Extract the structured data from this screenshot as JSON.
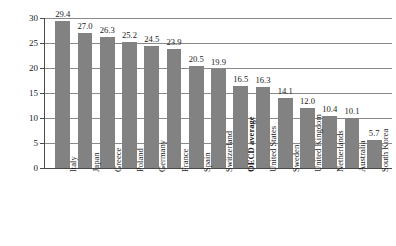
{
  "chart_data": {
    "type": "bar",
    "title": "",
    "xlabel": "",
    "ylabel": "Percentage of government spending",
    "ylim": [
      0,
      30
    ],
    "yticks": [
      0,
      5,
      10,
      15,
      20,
      25,
      30
    ],
    "ytick_labels": [
      "0",
      "5",
      "10",
      "15",
      "20",
      "25",
      "30"
    ],
    "grid": true,
    "legend": false,
    "bar_color": "#828282",
    "categories": [
      "Italy",
      "Japan",
      "Greece",
      "Poland",
      "Germany",
      "France",
      "Spain",
      "Switzerland",
      "OECD average",
      "United States",
      "Sweden",
      "United Kingdom",
      "Netherlands",
      "Australia",
      "South Korea"
    ],
    "values": [
      29.4,
      27.0,
      26.3,
      25.2,
      24.5,
      23.9,
      20.5,
      19.9,
      16.5,
      16.3,
      14.1,
      12.0,
      10.4,
      10.1,
      5.7
    ],
    "value_labels": [
      "29.4",
      "27.0",
      "26.3",
      "25.2",
      "24.5",
      "23.9",
      "20.5",
      "19.9",
      "16.5",
      "16.3",
      "14.1",
      "12.0",
      "10.4",
      "10.1",
      "5.7"
    ],
    "emphasized_categories": [
      "OECD average"
    ]
  }
}
